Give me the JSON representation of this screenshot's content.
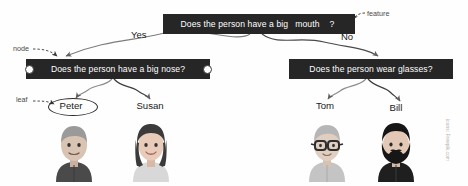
{
  "diagram": {
    "nodes": {
      "root": {
        "question_prefix": "Does the person have a big",
        "feature_word": "mouth",
        "question_suffix": "?"
      },
      "left": {
        "question": "Does the person have a big nose?"
      },
      "right": {
        "question": "Does the person wear glasses?"
      }
    },
    "edge_labels": {
      "yes": "Yes",
      "no": "No"
    },
    "annotations": {
      "node": "node",
      "leaf": "leaf",
      "feature": "feature"
    },
    "leaves": [
      {
        "name": "Peter",
        "avatar": "man-gray-hair-dark-shirt-avatar",
        "highlighted": true
      },
      {
        "name": "Susan",
        "avatar": "woman-dark-bob-light-shirt-avatar",
        "highlighted": false
      },
      {
        "name": "Tom",
        "avatar": "man-glasses-light-shirt-avatar",
        "highlighted": false
      },
      {
        "name": "Bill",
        "avatar": "man-beard-dark-shirt-avatar",
        "highlighted": false
      }
    ],
    "watermark": "icons: Freepik.com",
    "colors": {
      "node_fill": "#262626",
      "node_text": "#ffffff",
      "background": "#fefefe",
      "edge": "#6f6f6f",
      "annotation_text": "#4a4a4a",
      "label_text": "#1a1a1a"
    }
  }
}
